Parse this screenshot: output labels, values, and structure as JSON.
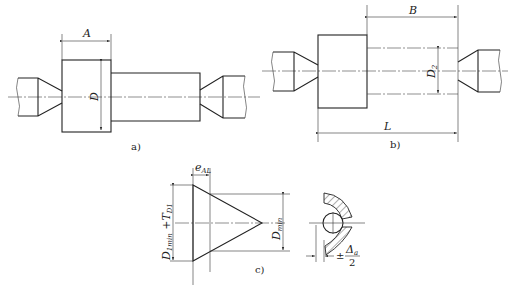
{
  "figure": {
    "panels": [
      {
        "id": "a",
        "caption": "a)",
        "labels": {
          "width": "A",
          "diameter": "D"
        }
      },
      {
        "id": "b",
        "caption": "b)",
        "labels": {
          "offset": "B",
          "diameter": "D",
          "diameter_sub": "2",
          "length": "L"
        }
      },
      {
        "id": "c",
        "caption": "c)",
        "labels": {
          "e": "e",
          "e_sub": "AL",
          "left_dim": "D",
          "left_dim_sub": "1min",
          "left_dim_plus": " +T",
          "left_dim_plus_sub": "D1",
          "right_dim": "D",
          "right_dim_sub": "min",
          "tol_prefix": "±",
          "tol_num": "Δ",
          "tol_num_sub": "a",
          "tol_den": "2"
        }
      }
    ]
  }
}
